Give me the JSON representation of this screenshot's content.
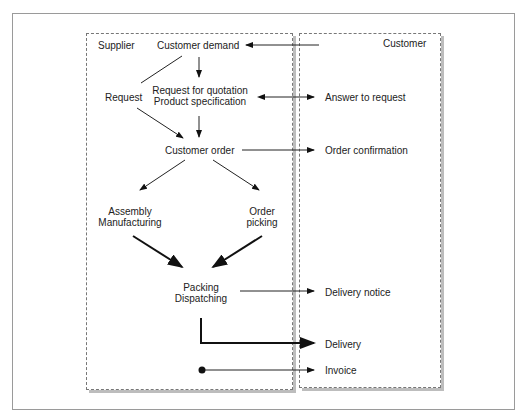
{
  "diagram": {
    "lanes": {
      "supplier": "Supplier",
      "customer": "Customer"
    },
    "nodes": {
      "customer_demand": "Customer demand",
      "request": "Request",
      "rfq_line1": "Request for quotation",
      "rfq_line2": "Product specification",
      "customer_order": "Customer order",
      "assembly_line1": "Assembly",
      "assembly_line2": "Manufacturing",
      "picking_line1": "Order",
      "picking_line2": "picking",
      "packing_line1": "Packing",
      "packing_line2": "Dispatching"
    },
    "customer_items": {
      "answer": "Answer to request",
      "confirmation": "Order confirmation",
      "delivery_notice": "Delivery notice",
      "delivery": "Delivery",
      "invoice": "Invoice"
    }
  }
}
